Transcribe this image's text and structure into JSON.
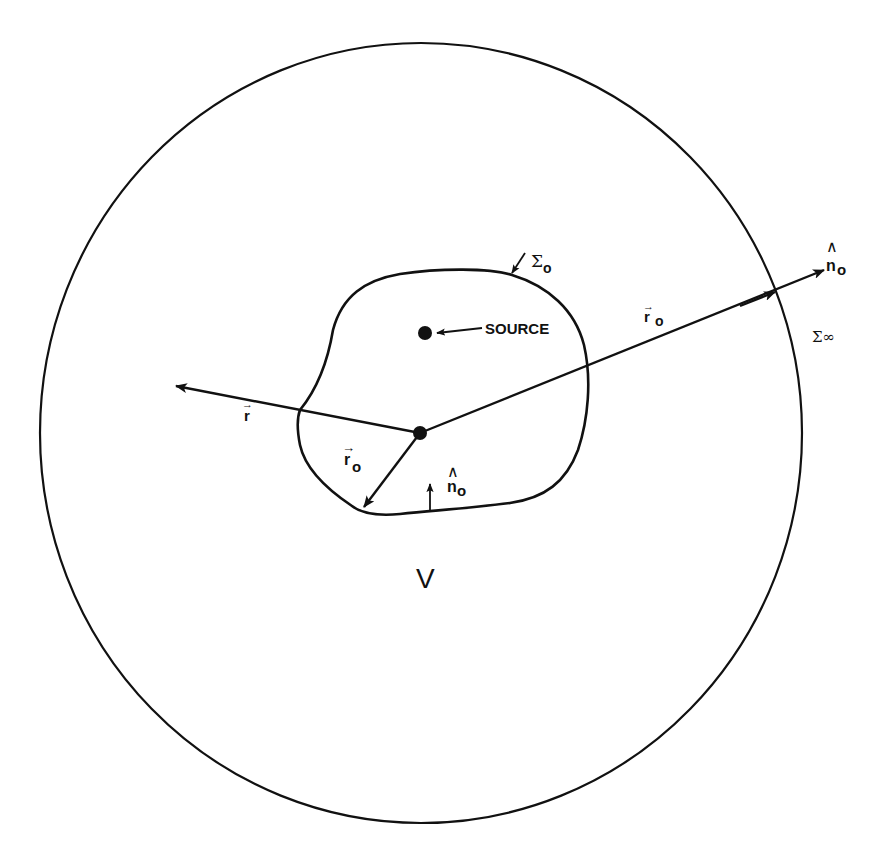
{
  "figure": {
    "colors": {
      "ink": "#111111",
      "background": "#ffffff"
    },
    "labels": {
      "source": "SOURCE",
      "inner_surface": "Σ",
      "inner_surface_sub": "o",
      "outer_surface": "Σ∞",
      "volume": "V",
      "r_vec": "r",
      "r0_vec_outer": "r",
      "r0_vec_outer_sub": "o",
      "r0_vec_inner": "r",
      "r0_vec_inner_sub": "o",
      "n0_outer": "n",
      "n0_outer_sub": "o",
      "n0_inner": "n",
      "n0_inner_sub": "o",
      "vec_arrow": "→",
      "hat": "∧"
    }
  }
}
